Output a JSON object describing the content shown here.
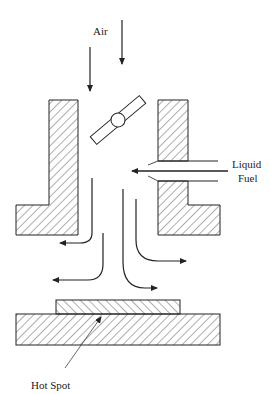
{
  "diagram": {
    "type": "engine intake port schematic with fuel injection and hot spot",
    "labels": {
      "air": "Air",
      "liquid_fuel_line1": "Liquid",
      "liquid_fuel_line2": "Fuel",
      "hot_spot": "Hot Spot"
    },
    "components": [
      "air inlet arrows",
      "throttle valve (butterfly)",
      "intake walls (hatched)",
      "liquid fuel injector tube",
      "flow arrows",
      "hot spot plate",
      "base wall (hatched)"
    ],
    "colors": {
      "line": "#222222",
      "background": "#ffffff"
    }
  }
}
